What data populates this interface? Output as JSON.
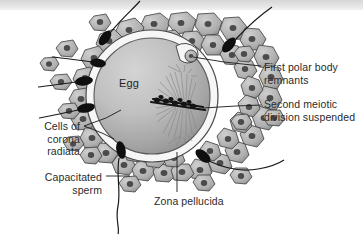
{
  "figure": {
    "canvas": {
      "width": 363,
      "height": 235,
      "background": "#ffffff"
    },
    "top_artifact": {
      "present": true,
      "color": "#dcdcdc"
    }
  },
  "labels": {
    "egg": "Egg",
    "first_polar_body": "First polar body\nremnants",
    "second_meiotic": "Second meiotic\ndivision suspended",
    "cells_of_corona_radiata": "Cells of\ncorona\nradiata",
    "capacitated_sperm": "Capacitated\nsperm",
    "zona_pellucida": "Zona pellucida"
  },
  "colors": {
    "text": "#2b2b2b",
    "leader_line": "#1a1a1a",
    "egg_fill_light": "#c9c9c9",
    "egg_fill_dark": "#8f8f8f",
    "egg_outline": "#4a4a4a",
    "zona_fill": "#f4f4f4",
    "zona_outline": "#555555",
    "corona_fill_light": "#c2c2c2",
    "corona_fill_dark": "#9a9a9a",
    "corona_outline": "#3d3d3d",
    "nucleus_fill": "#4f4f4f",
    "sperm_head": "#111111",
    "sperm_tail": "#1a1a1a",
    "spindle": "#7a7a7a",
    "chromosome": "#111111",
    "polar_body_fill": "#b5b5b5"
  },
  "structures": {
    "egg": {
      "cx": 152,
      "cy": 96,
      "r": 58,
      "label_x": 119,
      "label_y": 77
    },
    "zona_pellucida": {
      "cx": 152,
      "cy": 96,
      "r_outer": 66,
      "r_inner": 58
    },
    "polar_body": {
      "cx": 191,
      "cy": 56,
      "r": 6
    },
    "spindle": {
      "cx": 178,
      "cy": 102,
      "length": 58,
      "angle_deg": -62
    },
    "corona_radiata_cell_count": 46,
    "sperm_count": 7
  },
  "sperm": [
    {
      "id": "sperm-top-left",
      "head_x": 105,
      "head_y": 37,
      "angle": 118
    },
    {
      "id": "sperm-top-right",
      "head_x": 229,
      "head_y": 44,
      "angle": 54
    },
    {
      "id": "sperm-left-upper",
      "head_x": 84,
      "head_y": 81,
      "angle": 178
    },
    {
      "id": "sperm-left-lower",
      "head_x": 86,
      "head_y": 108,
      "angle": 190
    },
    {
      "id": "sperm-bottom-left",
      "head_x": 121,
      "head_y": 150,
      "angle": 255
    },
    {
      "id": "sperm-bottom-right",
      "head_x": 203,
      "head_y": 156,
      "angle": 310
    },
    {
      "id": "sperm-far-right",
      "head_x": 229,
      "head_y": 44,
      "angle": 40
    }
  ],
  "leader_lines": {
    "first_polar_body": {
      "from_x": 192,
      "from_y": 57,
      "to_x": 260,
      "to_y": 66
    },
    "second_meiotic": {
      "from_x": 183,
      "from_y": 104,
      "to_x": 260,
      "to_y": 104
    },
    "cells_of_corona": [
      {
        "from_x": 84,
        "from_y": 126,
        "to_x": 118,
        "to_y": 110
      },
      {
        "from_x": 84,
        "from_y": 126,
        "to_x": 112,
        "to_y": 138
      }
    ],
    "capacitated_sperm": {
      "from_x": 105,
      "from_y": 176,
      "to_x": 131,
      "to_y": 176
    },
    "zona_pellucida": {
      "from_x": 177,
      "from_y": 192,
      "to_x": 177,
      "to_y": 152
    }
  }
}
